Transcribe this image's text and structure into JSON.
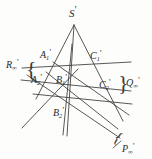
{
  "figure": {
    "kind": "projective-geometry-diagram",
    "title": "",
    "background_color": "#fdfdfc",
    "stroke_color": "#3a3a3a",
    "labels": {
      "apex": {
        "base": "S",
        "sub": "",
        "prime": "'"
      },
      "a1": {
        "base": "A",
        "sub": "1",
        "prime": "'"
      },
      "a2": {
        "base": "A",
        "sub": "2",
        "prime": "'"
      },
      "b1": {
        "base": "B",
        "sub": "1",
        "prime": "'"
      },
      "b2": {
        "base": "B",
        "sub": "2",
        "prime": "'"
      },
      "c1": {
        "base": "C",
        "sub": "1",
        "prime": "'"
      },
      "c2": {
        "base": "C",
        "sub": "2",
        "prime": "'"
      },
      "r_inf": {
        "base": "R",
        "sub": "∞",
        "prime": "'"
      },
      "q_inf": {
        "base": "Q",
        "sub": "∞",
        "prime": "'"
      },
      "p_inf": {
        "base": "P",
        "sub": "∞",
        "prime": "'"
      }
    },
    "braces": {
      "left": "{",
      "right": "}",
      "bottom": "{"
    },
    "points": {
      "S": [
        74,
        25
      ],
      "A1": [
        53,
        62
      ],
      "C1": [
        102,
        63
      ],
      "A2": [
        42,
        84
      ],
      "B1": [
        64,
        82
      ],
      "C2": [
        113,
        89
      ],
      "B2": [
        66,
        112
      ]
    }
  }
}
